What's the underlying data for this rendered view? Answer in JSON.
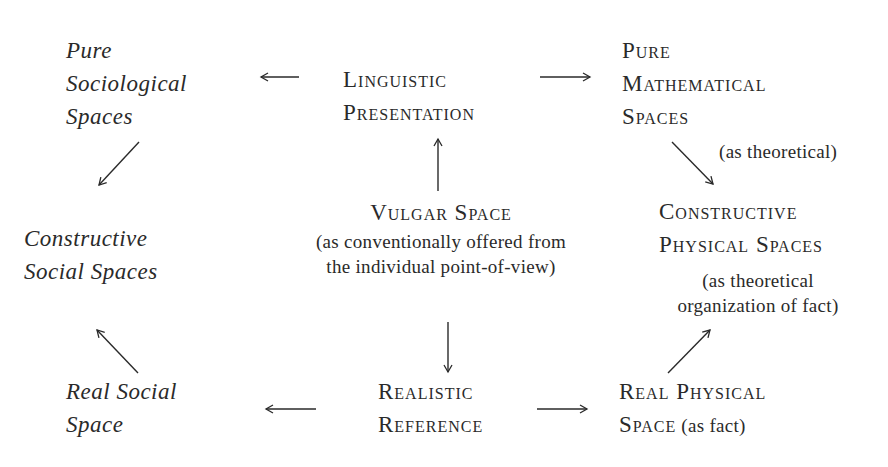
{
  "diagram": {
    "nodes": {
      "pure_sociological": {
        "lines": [
          "Pure",
          "Sociological",
          "Spaces"
        ],
        "style": "italic"
      },
      "linguistic_presentation": {
        "lines": [
          "Linguistic",
          "Presentation"
        ],
        "style": "small-caps"
      },
      "pure_mathematical": {
        "lines": [
          "Pure",
          "Mathematical",
          "Spaces"
        ],
        "style": "small-caps"
      },
      "constructive_social": {
        "lines": [
          "Constructive",
          "Social Spaces"
        ],
        "style": "italic"
      },
      "vulgar_space": {
        "title": "Vulgar Space",
        "note_lines": [
          "(as conventionally offered from",
          "the individual point-of-view)"
        ],
        "style": "small-caps"
      },
      "constructive_physical": {
        "lines": [
          "Constructive",
          "Physical Spaces"
        ],
        "note_lines": [
          "(as theoretical",
          "organization of fact)"
        ],
        "style": "small-caps"
      },
      "real_social": {
        "lines": [
          "Real Social",
          "Space"
        ],
        "style": "italic"
      },
      "realistic_reference": {
        "lines": [
          "Realistic",
          "Reference"
        ],
        "style": "small-caps"
      },
      "real_physical": {
        "line1": "Real Physical",
        "line2_sc": "Space",
        "line2_note": " (as fact)",
        "style": "small-caps"
      }
    },
    "edge_labels": {
      "pure_math_to_constructive_physical": "(as theoretical)"
    },
    "edges": [
      {
        "from": "linguistic_presentation",
        "to": "pure_sociological",
        "direction": "left"
      },
      {
        "from": "linguistic_presentation",
        "to": "pure_mathematical",
        "direction": "right"
      },
      {
        "from": "vulgar_space",
        "to": "linguistic_presentation",
        "direction": "up"
      },
      {
        "from": "pure_sociological",
        "to": "constructive_social",
        "direction": "down-left"
      },
      {
        "from": "pure_mathematical",
        "to": "constructive_physical",
        "direction": "down-right"
      },
      {
        "from": "vulgar_space",
        "to": "realistic_reference",
        "direction": "down"
      },
      {
        "from": "realistic_reference",
        "to": "real_social",
        "direction": "left"
      },
      {
        "from": "realistic_reference",
        "to": "real_physical",
        "direction": "right"
      },
      {
        "from": "real_social",
        "to": "constructive_social",
        "direction": "up-left"
      },
      {
        "from": "real_physical",
        "to": "constructive_physical",
        "direction": "up-right"
      }
    ],
    "colors": {
      "ink": "#2a2a2a",
      "background": "#ffffff"
    }
  }
}
